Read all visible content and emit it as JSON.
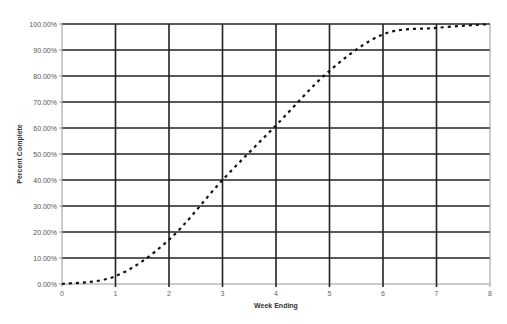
{
  "chart_data": {
    "type": "line",
    "title": "",
    "xlabel": "Week Ending",
    "ylabel": "Percent Complete",
    "x": [
      0,
      1,
      2,
      3,
      4,
      5,
      6,
      7,
      8
    ],
    "x_tick_labels": [
      "0",
      "1",
      "2",
      "3",
      "4",
      "5",
      "6",
      "7",
      "8"
    ],
    "y_tick_labels": [
      "0.00%",
      "10.00%",
      "20.00%",
      "30.00%",
      "40.00%",
      "50.00%",
      "60.00%",
      "70.00%",
      "80.00%",
      "90.00%",
      "100.00%"
    ],
    "series": [
      {
        "name": "Percent Complete",
        "line_style": "dotted",
        "color": "#111111",
        "values": [
          0,
          3,
          17,
          40,
          61,
          82,
          96,
          98.5,
          100
        ]
      }
    ],
    "xlim": [
      0,
      8
    ],
    "ylim": [
      0,
      100
    ],
    "grid": true,
    "legend": "none"
  }
}
